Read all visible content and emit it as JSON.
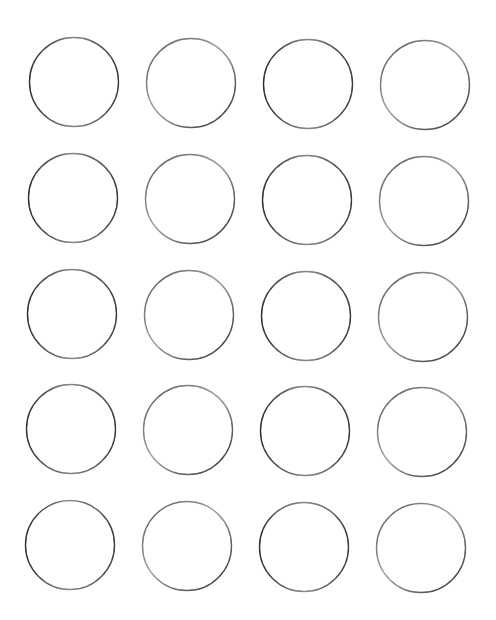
{
  "page": {
    "width": 496,
    "height": 620,
    "background": "#ffffff"
  },
  "template": {
    "shape": "circle",
    "columns": 4,
    "rows": 5,
    "radius": 44.5,
    "stroke_color": "#3a3a3a",
    "light_stroke_color": "#9a9a9a",
    "fill": "none"
  },
  "circles": [
    {
      "row": 1,
      "col": 1,
      "cx": 74,
      "cy": 82
    },
    {
      "row": 1,
      "col": 2,
      "cx": 191,
      "cy": 83
    },
    {
      "row": 1,
      "col": 3,
      "cx": 308,
      "cy": 84
    },
    {
      "row": 1,
      "col": 4,
      "cx": 425,
      "cy": 85
    },
    {
      "row": 2,
      "col": 1,
      "cx": 73,
      "cy": 198
    },
    {
      "row": 2,
      "col": 2,
      "cx": 190,
      "cy": 199
    },
    {
      "row": 2,
      "col": 3,
      "cx": 307,
      "cy": 200
    },
    {
      "row": 2,
      "col": 4,
      "cx": 424,
      "cy": 201
    },
    {
      "row": 3,
      "col": 1,
      "cx": 72,
      "cy": 314
    },
    {
      "row": 3,
      "col": 2,
      "cx": 189,
      "cy": 315
    },
    {
      "row": 3,
      "col": 3,
      "cx": 306,
      "cy": 316
    },
    {
      "row": 3,
      "col": 4,
      "cx": 423,
      "cy": 317
    },
    {
      "row": 4,
      "col": 1,
      "cx": 71,
      "cy": 429
    },
    {
      "row": 4,
      "col": 2,
      "cx": 188,
      "cy": 430
    },
    {
      "row": 4,
      "col": 3,
      "cx": 305,
      "cy": 431
    },
    {
      "row": 4,
      "col": 4,
      "cx": 422,
      "cy": 432
    },
    {
      "row": 5,
      "col": 1,
      "cx": 70,
      "cy": 545
    },
    {
      "row": 5,
      "col": 2,
      "cx": 187,
      "cy": 546
    },
    {
      "row": 5,
      "col": 3,
      "cx": 304,
      "cy": 547
    },
    {
      "row": 5,
      "col": 4,
      "cx": 421,
      "cy": 548
    }
  ]
}
